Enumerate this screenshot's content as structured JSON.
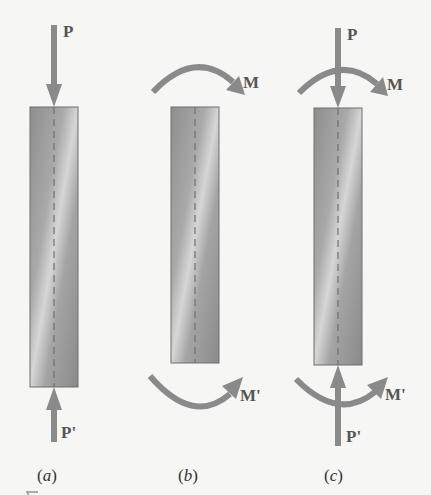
{
  "figure": {
    "panels": [
      {
        "id": "a",
        "caption": "(a)",
        "caption_open": "(",
        "caption_letter": "a",
        "caption_close": ")",
        "loads": {
          "top_force": "P",
          "bottom_force": "P'"
        }
      },
      {
        "id": "b",
        "caption": "(b)",
        "caption_open": "(",
        "caption_letter": "b",
        "caption_close": ")",
        "loads": {
          "top_moment": "M",
          "bottom_moment": "M'"
        }
      },
      {
        "id": "c",
        "caption": "(c)",
        "caption_open": "(",
        "caption_letter": "c",
        "caption_close": ")",
        "loads": {
          "top_force": "P",
          "top_moment": "M",
          "bottom_force": "P'",
          "bottom_moment": "M'"
        }
      }
    ],
    "colors": {
      "background": "#f6f6f4",
      "arrow": "#8a8a8a",
      "bar_dark": "#8c8c8c",
      "bar_light": "#d4d4d4",
      "label": "#555555",
      "caption": "#333333"
    }
  }
}
